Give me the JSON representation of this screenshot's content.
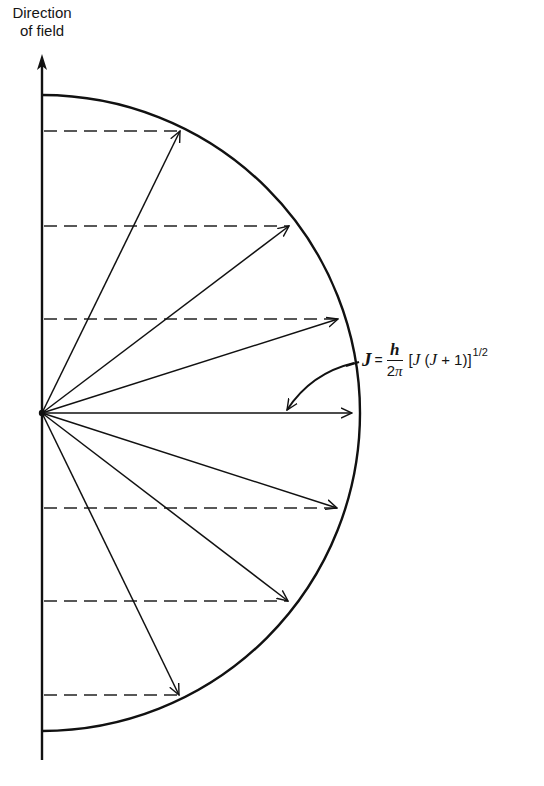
{
  "axis": {
    "label_line1": "Direction",
    "label_line2": "of field"
  },
  "formula": {
    "lhs": "J",
    "equals": "=",
    "numerator": "h",
    "denominator_num": "2",
    "denominator_sym": "π",
    "bracket_open": "[",
    "j1": "J",
    "paren_open": " (",
    "j2": "J",
    "plus_one": " + 1)",
    "bracket_close": "]",
    "exponent": "1/2"
  },
  "diagram": {
    "origin": {
      "x": 42,
      "y": 413
    },
    "radius": 310,
    "axis_top_y": 58,
    "axis_bottom_y": 760,
    "semicircle_top_y": 95,
    "semicircle_bottom_y": 731,
    "projection_levels": [
      {
        "m": 3,
        "y": 131,
        "vector_tip_x": 180
      },
      {
        "m": 2,
        "y": 226,
        "vector_tip_x": 289
      },
      {
        "m": 1,
        "y": 319,
        "vector_tip_x": 338
      },
      {
        "m": 0,
        "y": 413,
        "vector_tip_x": 352
      },
      {
        "m": -1,
        "y": 508,
        "vector_tip_x": 337
      },
      {
        "m": -2,
        "y": 601,
        "vector_tip_x": 288
      },
      {
        "m": -3,
        "y": 695,
        "vector_tip_x": 179
      }
    ],
    "annotation_arrow": {
      "from_x": 354,
      "from_y": 365,
      "to_x": 286,
      "to_y": 411
    },
    "colors": {
      "ink": "#111111",
      "background": "#ffffff"
    }
  }
}
